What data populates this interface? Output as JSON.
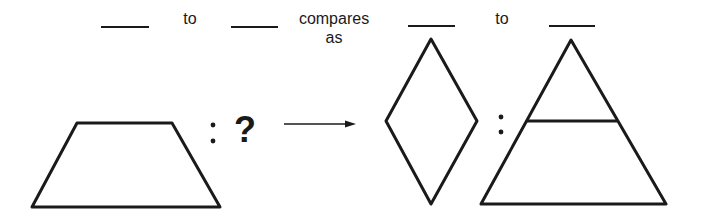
{
  "sentence": {
    "word_to_1": "to",
    "word_compares": "compares",
    "word_as": "as",
    "word_to_2": "to"
  },
  "blanks": [
    "",
    "",
    "",
    ""
  ],
  "analogy": {
    "left_pair": {
      "first": "trapezoid",
      "separator": ":",
      "second": "?"
    },
    "arrow": "right-arrow",
    "right_pair": {
      "first": "rhombus",
      "separator": ":",
      "second": "triangle-divided-by-horizontal-line"
    }
  },
  "colors": {
    "stroke": "#1a1a1a",
    "background": "#ffffff"
  }
}
